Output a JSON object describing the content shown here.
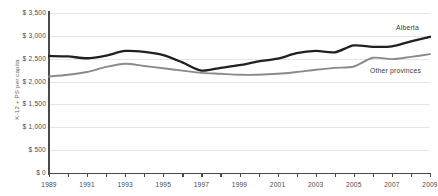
{
  "top_fragment": "",
  "chart_data": {
    "type": "line",
    "title": "",
    "xlabel": "",
    "ylabel": "K-12 + PS per capita",
    "xlim": [
      1989,
      2009
    ],
    "ylim": [
      0,
      3500
    ],
    "grid": true,
    "legend_position": "inline-right",
    "y_ticks": [
      0,
      500,
      1000,
      1500,
      2000,
      2500,
      3000,
      3500
    ],
    "y_tick_labels": [
      "$ 0",
      "$ 500",
      "$ 1,000",
      "$ 1,500",
      "$ 2,000",
      "$ 2,500",
      "$ 3,000",
      "$ 3,500"
    ],
    "x": [
      1989,
      1990,
      1991,
      1992,
      1993,
      1994,
      1995,
      1996,
      1997,
      1998,
      1999,
      2000,
      2001,
      2002,
      2003,
      2004,
      2005,
      2006,
      2007,
      2008,
      2009
    ],
    "x_tick_labels": [
      "1989",
      "1991",
      "1993",
      "1995",
      "1997",
      "1999",
      "2001",
      "2003",
      "2005",
      "2007",
      "2009"
    ],
    "x_tick_values": [
      1989,
      1991,
      1993,
      1995,
      1997,
      1999,
      2001,
      2003,
      2005,
      2007,
      2009
    ],
    "series": [
      {
        "name": "Alberta",
        "color": "#231f20",
        "values": [
          2560,
          2550,
          2510,
          2570,
          2670,
          2650,
          2580,
          2420,
          2240,
          2300,
          2360,
          2440,
          2500,
          2620,
          2670,
          2640,
          2790,
          2760,
          2770,
          2880,
          2980
        ]
      },
      {
        "name": "Other provinces",
        "color": "#8a8a8a",
        "values": [
          2110,
          2150,
          2210,
          2320,
          2390,
          2340,
          2290,
          2240,
          2190,
          2170,
          2150,
          2150,
          2170,
          2210,
          2260,
          2300,
          2330,
          2520,
          2490,
          2540,
          2600
        ]
      }
    ]
  }
}
